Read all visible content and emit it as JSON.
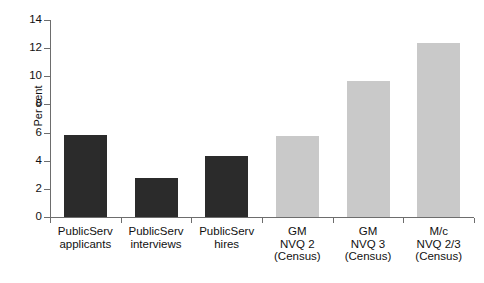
{
  "chart_data": {
    "type": "bar",
    "title": "",
    "subtitle": "",
    "xlabel": "",
    "ylabel": "Per cent",
    "ylim": [
      0,
      14
    ],
    "ytick_labels": [
      "0",
      "2",
      "4",
      "6",
      "8",
      "10",
      "12",
      "14"
    ],
    "ytick_values": [
      0,
      2,
      4,
      6,
      8,
      10,
      12,
      14
    ],
    "grid": false,
    "legend": null,
    "legend_position": "none",
    "categories": [
      "PublicServ\napplicants",
      "PublicServ\ninterviews",
      "PublicServ\nhires",
      "GM\nNVQ 2\n(Census)",
      "GM\nNVQ 3\n(Census)",
      "M/c\nNVQ 2/3\n(Census)"
    ],
    "values": [
      5.85,
      2.75,
      4.35,
      5.75,
      9.65,
      12.4
    ],
    "bar_colors": [
      "#2b2b2b",
      "#2b2b2b",
      "#2b2b2b",
      "#c9c9c9",
      "#c9c9c9",
      "#c9c9c9"
    ],
    "colors": {
      "dark_bar": "#2b2b2b",
      "light_bar": "#c9c9c9",
      "axis": "#6d6d6d",
      "text": "#111111",
      "background": "#ffffff"
    }
  }
}
